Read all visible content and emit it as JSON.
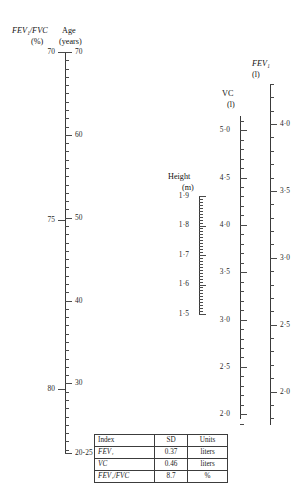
{
  "figure": {
    "type": "nomogram"
  },
  "axes": {
    "left": {
      "primary_header_line1": "FEV₁/FVC",
      "primary_header_line2": "(%)",
      "secondary_header_line1": "Age",
      "secondary_header_line2": "(years)",
      "left_labels": [
        "70",
        "75",
        "80"
      ],
      "left_values": [
        70,
        75,
        80
      ],
      "right_labels": [
        "70",
        "60",
        "50",
        "40",
        "30",
        "20-25"
      ],
      "right_values": [
        70,
        60,
        50,
        40,
        30,
        22
      ],
      "top_label": "70",
      "bottom_label": "20-25"
    },
    "height": {
      "header_line1": "Height",
      "header_line2": "(m)",
      "labels": [
        "1·9",
        "1·8",
        "1·7",
        "1·6",
        "1·5"
      ],
      "values": [
        1.9,
        1.8,
        1.7,
        1.6,
        1.5
      ],
      "units": "m"
    },
    "vc": {
      "header_line1": "VC",
      "header_line2": "(l)",
      "labels": [
        "5·0",
        "4·5",
        "4·0",
        "3·5",
        "3·0",
        "2·5",
        "2·0"
      ],
      "values": [
        5.0,
        4.5,
        4.0,
        3.5,
        3.0,
        2.5,
        2.0
      ],
      "units": "l"
    },
    "fev1": {
      "header_line1": "FEV₁",
      "header_line2": "(l)",
      "labels": [
        "4·0",
        "3·5",
        "3·0",
        "2·5",
        "2·0"
      ],
      "values": [
        4.0,
        3.5,
        3.0,
        2.5,
        2.0
      ],
      "units": "l"
    }
  },
  "table": {
    "headers": [
      "Index",
      "SD",
      "Units"
    ],
    "rows": [
      {
        "index": "FEV₁",
        "sd": "0.37",
        "units": "liters"
      },
      {
        "index": "VC",
        "sd": "0.46",
        "units": "liters"
      },
      {
        "index": "FEV₁/FVC",
        "sd": "8.7",
        "units": "%"
      }
    ]
  },
  "chart_data": {
    "type": "nomogram",
    "title": "",
    "scales": [
      {
        "name": "FEV1/FVC",
        "unit": "%",
        "side": "left",
        "tick_labels": [
          "70",
          "75",
          "80"
        ],
        "tick_values": [
          70,
          75,
          80
        ],
        "range": [
          70,
          82
        ]
      },
      {
        "name": "Age",
        "unit": "years",
        "side": "right",
        "tick_labels": [
          "70",
          "60",
          "50",
          "40",
          "30",
          "20-25"
        ],
        "tick_values": [
          70,
          60,
          50,
          40,
          30,
          22
        ],
        "range": [
          22,
          70
        ]
      },
      {
        "name": "Height",
        "unit": "m",
        "tick_labels": [
          "1·9",
          "1·8",
          "1·7",
          "1·6",
          "1·5"
        ],
        "tick_values": [
          1.9,
          1.8,
          1.7,
          1.6,
          1.5
        ],
        "range": [
          1.5,
          1.9
        ]
      },
      {
        "name": "VC",
        "unit": "l",
        "tick_labels": [
          "5·0",
          "4·5",
          "4·0",
          "3·5",
          "3·0",
          "2·5",
          "2·0"
        ],
        "tick_values": [
          5.0,
          4.5,
          4.0,
          3.5,
          3.0,
          2.5,
          2.0
        ],
        "range": [
          2.0,
          5.0
        ]
      },
      {
        "name": "FEV1",
        "unit": "l",
        "tick_labels": [
          "4·0",
          "3·5",
          "3·0",
          "2·5",
          "2·0"
        ],
        "tick_values": [
          4.0,
          3.5,
          3.0,
          2.5,
          2.0
        ],
        "range": [
          1.8,
          4.2
        ]
      }
    ],
    "table": {
      "columns": [
        "Index",
        "SD",
        "Units"
      ],
      "rows": [
        [
          "FEV1",
          0.37,
          "liters"
        ],
        [
          "VC",
          0.46,
          "liters"
        ],
        [
          "FEV1/FVC",
          8.7,
          "%"
        ]
      ]
    }
  }
}
